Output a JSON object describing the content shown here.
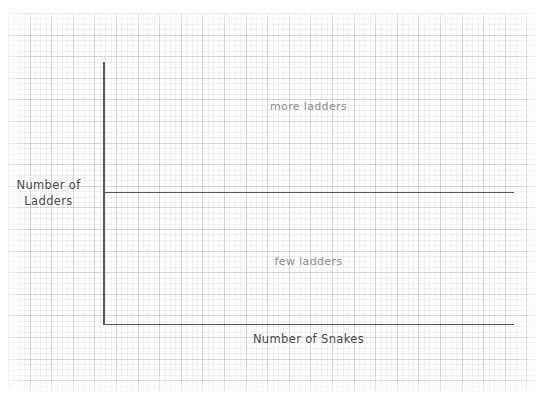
{
  "chart_data": {
    "type": "scatter",
    "title": "",
    "subtitle": "",
    "xlabel": "Number of Snakes",
    "ylabel": "Number of\nLadders",
    "ylabel_lines": [
      "Number of",
      "Ladders"
    ],
    "grid": true,
    "grid_style": "graph-paper",
    "legend": null,
    "x": [],
    "y": [],
    "series": [],
    "xlim": [
      0,
      1
    ],
    "ylim": [
      0,
      1
    ],
    "xticks": [],
    "yticks": [],
    "xticklabels": [],
    "yticklabels": [],
    "annotations": [
      {
        "text": "more ladders",
        "region": "upper",
        "x_frac": 0.5,
        "y_frac": 0.855,
        "color": "#8d8d8d"
      },
      {
        "text": "few ladders",
        "region": "lower",
        "x_frac": 0.5,
        "y_frac": 0.265,
        "color": "#8d8d8d"
      }
    ],
    "reference_lines": [
      {
        "orientation": "horizontal",
        "y_frac": 0.5,
        "label": "",
        "color": "#585858"
      }
    ],
    "colors": {
      "axis": "#585858",
      "axis_label_text": "#4a4a4a",
      "annotation_text": "#8d8d8d",
      "grid_major": "#96969f",
      "grid_minor": "#aaaab9",
      "background": "#ffffff"
    }
  },
  "axes": {
    "y_label_line1": "Number of",
    "y_label_line2": "Ladders",
    "x_label": "Number of Snakes"
  },
  "notes": {
    "upper": "more ladders",
    "lower": "few ladders"
  }
}
